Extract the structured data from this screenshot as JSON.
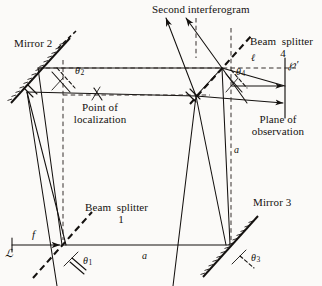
{
  "figure": {
    "background": "#fbfaf8",
    "ink": "#14110f",
    "width": 322,
    "height": 286
  },
  "labels": {
    "mirror2": "Mirror 2",
    "mirror3": "Mirror 3",
    "beam_splitter_1_line1": "Beam  splitter",
    "beam_splitter_1_line2": "1",
    "beam_splitter_4_line1": "Beam  splitter",
    "beam_splitter_4_line2": "4",
    "second_interferogram": "Second interferogram",
    "point_of_localization_line1": "Point of",
    "point_of_localization_line2": "localization",
    "plane_of_observation_line1": "Plane of",
    "plane_of_observation_line2": "observation",
    "theta1": "θ",
    "theta1_sub": "1",
    "theta2": "θ",
    "theta2_sub": "2",
    "theta3": "θ",
    "theta3_sub": "3",
    "theta4": "θ",
    "theta4_sub": "4",
    "source": "ℒ",
    "freq": "f",
    "ell": "ℓ",
    "origin_prime": "℘′",
    "a_horizontal": "a",
    "a_vertical": "a"
  },
  "geometry": {
    "beam_splitter_1": {
      "x": 62,
      "y": 245,
      "name": "Beam splitter 1"
    },
    "mirror_3": {
      "x": 230,
      "y": 245,
      "name": "Mirror 3"
    },
    "mirror_2": {
      "x": 38,
      "y": 68,
      "name": "Mirror 2"
    },
    "beam_splitter_4": {
      "x": 222,
      "y": 68,
      "name": "Beam splitter 4"
    },
    "plane_of_observation_x": 285,
    "source_x": 12,
    "source_y": 245
  },
  "colors": {
    "ink": "#14110f",
    "paper": "#fbfaf8",
    "dashed": "#2a2522"
  }
}
